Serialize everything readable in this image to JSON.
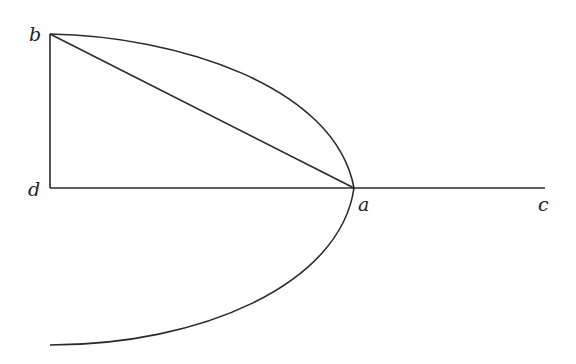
{
  "diagram": {
    "type": "geometric-figure",
    "stroke_color": "#2a2a2a",
    "points": {
      "b": {
        "label": "b",
        "x": 50,
        "y": 34
      },
      "d": {
        "label": "d",
        "x": 50,
        "y": 188
      },
      "a": {
        "label": "a",
        "x": 354,
        "y": 188
      },
      "c": {
        "label": "c",
        "x": 545,
        "y": 188
      }
    },
    "segments": [
      {
        "name": "bd",
        "from": "b",
        "to": "d"
      },
      {
        "name": "ba",
        "from": "b",
        "to": "a"
      },
      {
        "name": "dc",
        "from": "d",
        "to": "c"
      }
    ],
    "curves": [
      {
        "name": "upper-arc",
        "from": "b",
        "to": "a"
      },
      {
        "name": "lower-arc",
        "from": "a",
        "to": "lower-end"
      }
    ],
    "labels": {
      "b": "b",
      "d": "d",
      "a": "a",
      "c": "c"
    }
  }
}
